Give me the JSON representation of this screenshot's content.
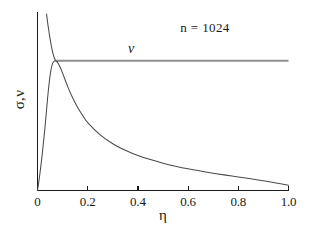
{
  "chart_data": {
    "type": "line",
    "title": "",
    "subtitle": "",
    "xlabel": "η",
    "ylabel": "σ,ν",
    "xlim": [
      0,
      1.0
    ],
    "ylim": [
      0,
      1.0
    ],
    "grid": false,
    "legend_position": "inline-annotation",
    "xticks": [
      "0",
      "0.2",
      "0.4",
      "0.6",
      "0.8",
      "1.0"
    ],
    "xtick_values": [
      0,
      0.2,
      0.4,
      0.6,
      0.8,
      1.0
    ],
    "yticks": [],
    "ytick_values": [],
    "annotations": [
      {
        "text": "n = 1024",
        "x": 0.67,
        "y": 0.95
      },
      {
        "text": "ν",
        "x": 0.375,
        "y": 0.8
      }
    ],
    "series": [
      {
        "name": "ν",
        "label": "ν",
        "style": "flat-line",
        "color": "#8e8e8e",
        "x": [
          0.075,
          1.0
        ],
        "values": [
          0.735,
          0.735
        ]
      },
      {
        "name": "σ",
        "label": "σ",
        "style": "peaked-decay",
        "color": "#4a4a4a",
        "x": [
          0.0,
          0.01,
          0.02,
          0.03,
          0.04,
          0.05,
          0.06,
          0.07,
          0.08,
          0.09,
          0.1,
          0.12,
          0.14,
          0.16,
          0.18,
          0.2,
          0.25,
          0.3,
          0.35,
          0.4,
          0.45,
          0.5,
          0.55,
          0.6,
          0.65,
          0.7,
          0.75,
          0.8,
          0.85,
          0.9,
          0.95,
          1.0
        ],
        "values": [
          0.0,
          0.1,
          0.22,
          0.36,
          0.52,
          0.65,
          0.72,
          0.735,
          0.725,
          0.7,
          0.665,
          0.59,
          0.525,
          0.47,
          0.425,
          0.385,
          0.315,
          0.265,
          0.228,
          0.198,
          0.175,
          0.155,
          0.138,
          0.123,
          0.11,
          0.098,
          0.087,
          0.077,
          0.066,
          0.055,
          0.043,
          0.03
        ]
      },
      {
        "name": "σ-upper-branch",
        "label": "",
        "style": "descending-branch",
        "color": "#4a4a4a",
        "x": [
          0.036,
          0.04,
          0.045,
          0.05,
          0.055,
          0.06,
          0.065,
          0.07,
          0.075,
          0.08
        ],
        "values": [
          1.0,
          0.955,
          0.905,
          0.86,
          0.82,
          0.785,
          0.76,
          0.742,
          0.733,
          0.728
        ]
      }
    ]
  },
  "axes": {
    "x_axis_name": "eta-axis",
    "y_axis_name": "sigma-nu-axis"
  }
}
